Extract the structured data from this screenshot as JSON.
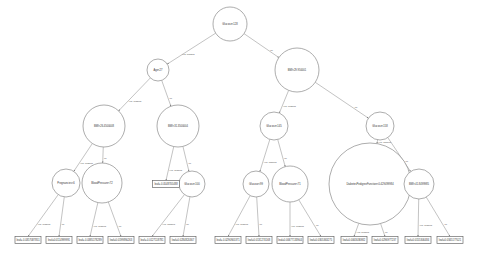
{
  "diagram": {
    "type": "decision-tree",
    "colors": {
      "stroke": "#8a8a8a",
      "text": "#333333",
      "background": "#ffffff"
    },
    "nodes": [
      {
        "id": "n0",
        "label": "Glucose<128",
        "x": 230,
        "y": 24,
        "r": 17
      },
      {
        "id": "n1",
        "label": "Age<27",
        "x": 158,
        "y": 70,
        "r": 11
      },
      {
        "id": "n2",
        "label": "BMI<29.950001",
        "x": 297,
        "y": 70,
        "r": 22
      },
      {
        "id": "n3",
        "label": "BMI<26.4500008",
        "x": 104,
        "y": 126,
        "r": 21
      },
      {
        "id": "n4",
        "label": "BMI<31.3500004",
        "x": 178,
        "y": 126,
        "r": 21
      },
      {
        "id": "n5",
        "label": "Glucose<145",
        "x": 274,
        "y": 126,
        "r": 14
      },
      {
        "id": "n6",
        "label": "Glucose<158",
        "x": 380,
        "y": 126,
        "r": 14
      },
      {
        "id": "n7",
        "label": "Pregnancies<6",
        "x": 66,
        "y": 183,
        "r": 14
      },
      {
        "id": "n8",
        "label": "BloodPressure<72",
        "x": 102,
        "y": 183,
        "r": 20
      },
      {
        "id": "n10",
        "label": "Glucose<100",
        "x": 192,
        "y": 184,
        "r": 13
      },
      {
        "id": "n11",
        "label": "Glucose<99",
        "x": 256,
        "y": 184,
        "r": 13
      },
      {
        "id": "n12",
        "label": "BloodPressure<71",
        "x": 290,
        "y": 184,
        "r": 18
      },
      {
        "id": "n13",
        "label": "DiabetesPedigreeFunction<0.429499984",
        "x": 370,
        "y": 184,
        "r": 41
      },
      {
        "id": "n14",
        "label": "BMI<41.8499985",
        "x": 419,
        "y": 184,
        "r": 15
      }
    ],
    "leaves": [
      {
        "id": "l9",
        "label": "leaf=-0.0548705488",
        "x": 166,
        "y": 184,
        "w": 27
      },
      {
        "id": "l15",
        "label": "leaf=-0.0357087851",
        "x": 28,
        "y": 240,
        "w": 26
      },
      {
        "id": "l16",
        "label": "leaf=0.0114999991",
        "x": 59,
        "y": 240,
        "w": 26
      },
      {
        "id": "l17",
        "label": "leaf=-0.0385178289",
        "x": 90,
        "y": 240,
        "w": 26
      },
      {
        "id": "l18",
        "label": "leaf=0.0199890263",
        "x": 121,
        "y": 240,
        "w": 26
      },
      {
        "id": "l19",
        "label": "leaf=-0.0127118781",
        "x": 152,
        "y": 240,
        "w": 26
      },
      {
        "id": "l20",
        "label": "leaf=0.0284820367",
        "x": 183,
        "y": 240,
        "w": 26
      },
      {
        "id": "l21",
        "label": "leaf=-0.0290905371",
        "x": 228,
        "y": 240,
        "w": 26
      },
      {
        "id": "l22",
        "label": "leaf=0.0131274168",
        "x": 259,
        "y": 240,
        "w": 26
      },
      {
        "id": "l23",
        "label": "leaf=0.00677133944",
        "x": 290,
        "y": 240,
        "w": 26
      },
      {
        "id": "l24",
        "label": "leaf=0.0305363275",
        "x": 321,
        "y": 240,
        "w": 26
      },
      {
        "id": "l25",
        "label": "leaf=0.0063036982",
        "x": 354,
        "y": 240,
        "w": 26
      },
      {
        "id": "l26",
        "label": "leaf=0.0296977237",
        "x": 385,
        "y": 240,
        "w": 26
      },
      {
        "id": "l27",
        "label": "leaf=0.0155306484",
        "x": 418,
        "y": 240,
        "w": 26
      },
      {
        "id": "l28",
        "label": "leaf=0.0345177021",
        "x": 450,
        "y": 240,
        "w": 26
      }
    ],
    "edges": [
      {
        "from": "n0",
        "to": "n1",
        "label": "yes, missing"
      },
      {
        "from": "n0",
        "to": "n2",
        "label": "no"
      },
      {
        "from": "n1",
        "to": "n3",
        "label": "yes, missing"
      },
      {
        "from": "n1",
        "to": "n4",
        "label": "no"
      },
      {
        "from": "n2",
        "to": "n5",
        "label": "yes, missing"
      },
      {
        "from": "n2",
        "to": "n6",
        "label": "no"
      },
      {
        "from": "n3",
        "to": "n7",
        "label": "yes, missing"
      },
      {
        "from": "n3",
        "to": "n8",
        "label": "no"
      },
      {
        "from": "n4",
        "to": "l9",
        "label": "yes, missing"
      },
      {
        "from": "n4",
        "to": "n10",
        "label": "no"
      },
      {
        "from": "n5",
        "to": "n11",
        "label": "yes, missing"
      },
      {
        "from": "n5",
        "to": "n12",
        "label": "no"
      },
      {
        "from": "n6",
        "to": "n13",
        "label": "yes, missing"
      },
      {
        "from": "n6",
        "to": "n14",
        "label": "no"
      },
      {
        "from": "n7",
        "to": "l15",
        "label": "yes, missing"
      },
      {
        "from": "n7",
        "to": "l16",
        "label": "no"
      },
      {
        "from": "n8",
        "to": "l17",
        "label": "yes, missing"
      },
      {
        "from": "n8",
        "to": "l18",
        "label": "no"
      },
      {
        "from": "n10",
        "to": "l19",
        "label": "yes, missing"
      },
      {
        "from": "n10",
        "to": "l20",
        "label": "no"
      },
      {
        "from": "n11",
        "to": "l21",
        "label": "yes, missing"
      },
      {
        "from": "n11",
        "to": "l22",
        "label": "no"
      },
      {
        "from": "n12",
        "to": "l23",
        "label": "yes, missing"
      },
      {
        "from": "n12",
        "to": "l24",
        "label": "no"
      },
      {
        "from": "n13",
        "to": "l25",
        "label": "yes, missing"
      },
      {
        "from": "n13",
        "to": "l26",
        "label": "no"
      },
      {
        "from": "n14",
        "to": "l27",
        "label": "yes, missing"
      },
      {
        "from": "n14",
        "to": "l28",
        "label": "no"
      }
    ]
  }
}
